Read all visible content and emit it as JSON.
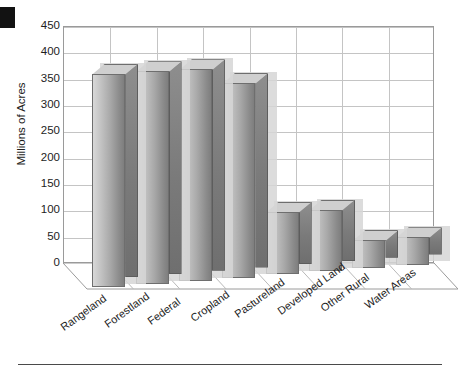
{
  "chart_data": {
    "type": "bar",
    "title": "",
    "subtitle": "",
    "xlabel": "",
    "ylabel": "Millions of Acres",
    "ylim": [
      0,
      450
    ],
    "ytick_values": [
      0,
      50,
      100,
      150,
      200,
      250,
      300,
      350,
      400,
      450
    ],
    "ytick_labels": [
      "0",
      "50",
      "100",
      "150",
      "200",
      "250",
      "300",
      "350",
      "400",
      "450"
    ],
    "grid": true,
    "legend": "none",
    "three_d": true,
    "categories": [
      "Rangeland",
      "Forestland",
      "Federal",
      "Cropland",
      "Pastureland",
      "Developed Land",
      "Other Rural",
      "Water Areas"
    ],
    "values": [
      406,
      404,
      402,
      370,
      119,
      117,
      53,
      52
    ],
    "series": [
      {
        "name": "Land area",
        "values": [
          406,
          404,
          402,
          370,
          119,
          117,
          53,
          52
        ]
      }
    ]
  },
  "colors": {
    "bar_front_light": "#d8d8d8",
    "bar_front_dark": "#7e7e7e",
    "bar_side": "#7a7a7a",
    "bar_top": "#cfcfcf",
    "bar_outline": "#6e6e6e",
    "gridline": "#c4c4c4",
    "frame": "#9a9a9a",
    "text": "#1d1d1d",
    "page_background": "#ffffff",
    "corner_mark": "#121212",
    "shadow": "#d6d6d6"
  },
  "decorations": {
    "corner_mark_label": "page-corner-mark",
    "bottom_rule_label": "page-bottom-rule"
  }
}
